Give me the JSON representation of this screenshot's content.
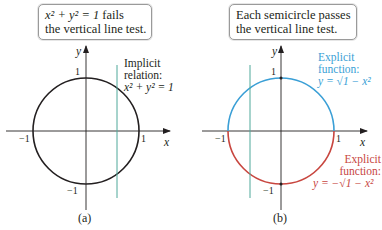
{
  "colors": {
    "axis": "#231f20",
    "circle": "#231f20",
    "vertical_line": "#4fa89a",
    "upper_semicircle": "#3a9fd6",
    "lower_semicircle": "#c8463f",
    "callout_border": "#9a9a9a"
  },
  "panel_a": {
    "callout": {
      "line1_eq": "x² + y² = 1",
      "line1_rest": " fails",
      "line2": "the vertical line test."
    },
    "annotation": {
      "line1": "Implicit",
      "line2": "relation:",
      "line3": "x² + y² = 1"
    },
    "axis_labels": {
      "x": "x",
      "y": "y"
    },
    "ticks": {
      "y_top": "1",
      "y_bottom": "−1",
      "x_left": "−1",
      "x_right": "1"
    },
    "caption": "(a)"
  },
  "panel_b": {
    "callout": {
      "line1": "Each semicircle passes",
      "line2": "the vertical line test."
    },
    "upper_annotation": {
      "line1": "Explicit",
      "line2": "function:",
      "line3": "y = √1 − x²"
    },
    "lower_annotation": {
      "line1": "Explicit",
      "line2": "function:",
      "line3": "y = −√1 − x²"
    },
    "axis_labels": {
      "x": "x",
      "y": "y"
    },
    "ticks": {
      "y_top": "1",
      "y_bottom": "−1",
      "x_left": "−1",
      "x_right": "1"
    },
    "caption": "(b)"
  }
}
